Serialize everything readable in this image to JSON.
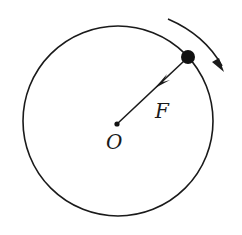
{
  "diagram": {
    "type": "circular-motion-force-diagram",
    "colors": {
      "stroke": "#1a1a1a",
      "background": "#ffffff"
    },
    "circle": {
      "cx": 118,
      "cy": 121,
      "r": 95
    },
    "center_point": {
      "x": 117,
      "y": 124,
      "label": "O"
    },
    "particle": {
      "x": 188,
      "y": 57,
      "r": 7
    },
    "force": {
      "label": "F",
      "from": [
        184,
        61
      ],
      "to": [
        117,
        124
      ],
      "direction": "toward-center"
    },
    "motion_arrow": {
      "direction": "clockwise"
    }
  }
}
